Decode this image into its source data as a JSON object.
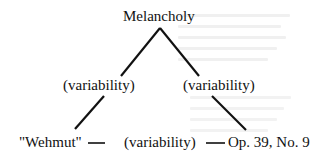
{
  "diagram": {
    "root": "Melancholy",
    "left_edge_label": "(variability)",
    "right_edge_label": "(variability)",
    "bottom_left": "\"Wehmut\"",
    "bottom_edge_label": "(variability)",
    "bottom_right": "Op. 39, No. 9",
    "connector_dash": "—"
  },
  "colors": {
    "ink": "#111111",
    "background": "#ffffff",
    "bleed_through": "#f0f0f0"
  }
}
